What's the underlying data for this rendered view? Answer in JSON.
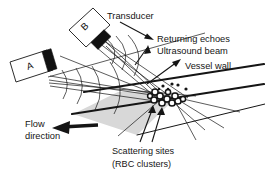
{
  "figure": {
    "type": "diagram",
    "background_color": "#ffffff",
    "ink_color": "#151515",
    "vessel_fill_color": "#d8d8d8"
  },
  "labels": {
    "transducer": "Transducer",
    "returning_echoes": "Returning echoes",
    "ultrasound_beam": "Ultrasound beam",
    "vessel_wall": "Vessel wall",
    "flow_direction_line1": "Flow",
    "flow_direction_line2": "direction",
    "scattering_sites_line1": "Scattering sites",
    "scattering_sites_line2": "(RBC clusters)"
  },
  "transducers": [
    {
      "id": "A",
      "label": "A",
      "tip_color": "#111111"
    },
    {
      "id": "B",
      "label": "B",
      "tip_color": "#111111"
    }
  ],
  "icons": {
    "flow_arrow": "left-arrow-icon",
    "echo_arrow": "right-arrow-icon",
    "beam_arrow": "down-arrow-icon",
    "wall_arrow": "up-right-arrow-icon",
    "scatter_arrow": "up-arrow-icon"
  },
  "scattering_sites": {
    "cluster_count": 11,
    "dot_count": 6,
    "description": "circular red blood cell clusters inside vessel lumen"
  }
}
